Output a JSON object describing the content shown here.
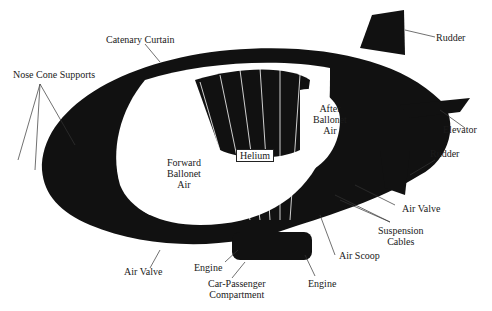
{
  "diagram": {
    "labels": {
      "catenary_curtain": "Catenary Curtain",
      "nose_cone_supports": "Nose Cone Supports",
      "rudder_top": "Rudder",
      "elevator": "Elevator",
      "rudder_lower": "Rudder",
      "after_ballonet": [
        "After",
        "Ballonet",
        "Air"
      ],
      "forward_ballonet": [
        "Forward",
        "Ballonet",
        "Air"
      ],
      "helium": "Helium",
      "air_valve_right": "Air Valve",
      "suspension_cables": [
        "Suspension",
        "Cables"
      ],
      "air_scoop": "Air Scoop",
      "engine_left": "Engine",
      "engine_right": "Engine",
      "car": [
        "Car-Passenger",
        "Compartment"
      ],
      "air_valve_left": "Air Valve"
    }
  }
}
